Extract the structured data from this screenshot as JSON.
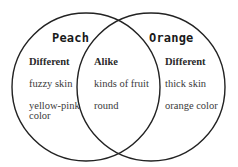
{
  "diagram": {
    "type": "venn",
    "colors": {
      "stroke": "#222222",
      "text": "#333333",
      "background": "#ffffff"
    },
    "left": {
      "title": "Peach",
      "heading": "Different",
      "items": [
        "fuzzy skin",
        "yellow-pink\ncolor"
      ]
    },
    "overlap": {
      "heading": "Alike",
      "items": [
        "kinds of fruit",
        "round"
      ]
    },
    "right": {
      "title": "Orange",
      "heading": "Different",
      "items": [
        "thick skin",
        "orange color"
      ]
    }
  }
}
